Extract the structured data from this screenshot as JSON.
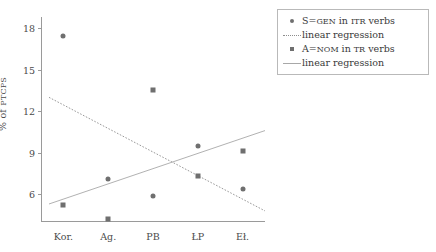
{
  "chart_data": {
    "type": "scatter",
    "title": "",
    "xlabel": "",
    "ylabel_prefix": "% of ",
    "ylabel_smallcaps": "PTCPS",
    "ylabel": "% of PTCPS",
    "categories": [
      "Kor.",
      "Ag.",
      "PB",
      "ŁP",
      "Eł."
    ],
    "ylim": [
      4.0,
      18.8
    ],
    "yticks": [
      6,
      9,
      12,
      15,
      18
    ],
    "ytick_labels": [
      "6",
      "9",
      "12",
      "15",
      "18"
    ],
    "grid": false,
    "legend_position": "right-outside",
    "series": [
      {
        "name": "S=GEN in ITR verbs",
        "name_parts": {
          "pre": "S=",
          "sc1": "GEN",
          "mid": " in ",
          "sc2": "ITR",
          "post": " verbs"
        },
        "marker": "circle",
        "color": "#6f6f6f",
        "values": [
          17.4,
          7.1,
          5.9,
          9.5,
          6.4
        ]
      },
      {
        "name": "A=NOM in TR verbs",
        "name_parts": {
          "pre": "A=",
          "sc1": "NOM",
          "mid": " in ",
          "sc2": "TR",
          "post": " verbs"
        },
        "marker": "square",
        "color": "#6f6f6f",
        "values": [
          5.2,
          4.2,
          13.5,
          7.3,
          9.1
        ]
      }
    ],
    "trendlines": [
      {
        "name": "linear regression",
        "for_series": "S=GEN in ITR verbs",
        "style": "dotted",
        "color": "#8d8d8d",
        "y_start": 13.0,
        "y_end": 4.8
      },
      {
        "name": "linear regression",
        "for_series": "A=NOM in TR verbs",
        "style": "solid",
        "color": "#a8a8a8",
        "y_start": 5.3,
        "y_end": 10.6
      }
    ]
  },
  "legend": {
    "entries": [
      {
        "key": "circle-marker",
        "label": "S=GEN in ITR verbs"
      },
      {
        "key": "dotted-line",
        "label": "linear regression"
      },
      {
        "key": "square-marker",
        "label": "A=NOM in TR verbs"
      },
      {
        "key": "solid-line",
        "label": "linear regression"
      }
    ]
  }
}
